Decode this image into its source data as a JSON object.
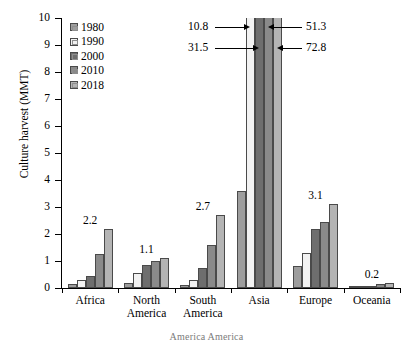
{
  "chart_data": {
    "type": "bar",
    "title": "",
    "xlabel": "",
    "ylabel": "Culture harvest (MMT)",
    "ylim": [
      0,
      10
    ],
    "ytick_labels": [
      "0",
      "1",
      "2",
      "3",
      "4",
      "5",
      "6",
      "7",
      "8",
      "9",
      "10"
    ],
    "grid": false,
    "legend_position": "top-left",
    "categories": [
      "Africa",
      "North America",
      "South America",
      "Asia",
      "Europe",
      "Oceania"
    ],
    "category_labels": [
      "Africa",
      "North\nAmerica",
      "South\nAmerica",
      "Asia",
      "Europe",
      "Oceania"
    ],
    "series": [
      {
        "name": "1980",
        "color": "#9d9d9d",
        "values": [
          0.15,
          0.18,
          0.1,
          3.6,
          0.8,
          0.01
        ]
      },
      {
        "name": "1990",
        "color": "#f2f2f2",
        "values": [
          0.3,
          0.55,
          0.3,
          10.8,
          1.3,
          0.02
        ]
      },
      {
        "name": "2000",
        "color": "#6e6e6e",
        "values": [
          0.45,
          0.85,
          0.75,
          31.5,
          2.2,
          0.06
        ]
      },
      {
        "name": "2010",
        "color": "#8a8a8a",
        "values": [
          1.25,
          1.0,
          1.6,
          51.3,
          2.45,
          0.14
        ]
      },
      {
        "name": "2018",
        "color": "#b4b4b4",
        "values": [
          2.2,
          1.1,
          2.7,
          72.8,
          3.1,
          0.2
        ]
      }
    ],
    "value_labels": [
      {
        "category": "Africa",
        "text": "2.2"
      },
      {
        "category": "North America",
        "text": "1.1"
      },
      {
        "category": "South America",
        "text": "2.7"
      },
      {
        "category": "Europe",
        "text": "3.1"
      },
      {
        "category": "Oceania",
        "text": "0.2"
      }
    ],
    "annotations": [
      {
        "text": "10.8",
        "series": "1990",
        "side": "left",
        "category": "Asia"
      },
      {
        "text": "31.5",
        "series": "2000",
        "side": "left",
        "category": "Asia"
      },
      {
        "text": "51.3",
        "series": "2010",
        "side": "right",
        "category": "Asia"
      },
      {
        "text": "72.8",
        "series": "2018",
        "side": "right",
        "category": "Asia"
      }
    ],
    "note": "Asia bars for 1990-2018 exceed the axis maximum of 10 and are clipped; their values are shown as arrow annotations."
  },
  "caption": "America    America"
}
